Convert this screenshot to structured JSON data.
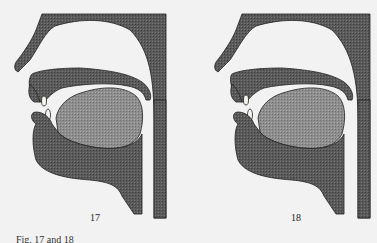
{
  "figures": [
    {
      "number": "17",
      "label": "Sagittal section of vocal tract, tongue raised toward soft palate"
    },
    {
      "number": "18",
      "label": "Sagittal section of vocal tract, tongue in similar position"
    }
  ],
  "caption": "Fig. 17 and 18",
  "colors": {
    "background": "#f2f2f2",
    "dark_tissue": "#555555",
    "tongue": "#8a8a8a",
    "outline": "#222222",
    "teeth": "#f5f5f0"
  }
}
